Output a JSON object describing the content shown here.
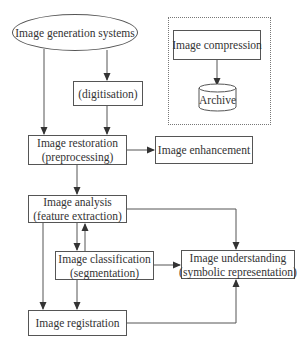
{
  "diagram": {
    "nodes": {
      "generation": {
        "line1": "Image generation systems",
        "shape": "ellipse"
      },
      "digitisation": {
        "line1": "(digitisation)",
        "shape": "rect"
      },
      "restoration": {
        "line1": "Image restoration",
        "line2": "(preprocessing)",
        "shape": "rect"
      },
      "enhancement": {
        "line1": "Image enhancement",
        "shape": "rect"
      },
      "compression": {
        "line1": "Image compression",
        "shape": "rect"
      },
      "archive": {
        "line1": "Archive",
        "shape": "cylinder"
      },
      "analysis": {
        "line1": "Image analysis",
        "line2": "(feature extraction)",
        "shape": "rect"
      },
      "classification": {
        "line1": "Image classification",
        "line2": "(segmentation)",
        "shape": "rect"
      },
      "understanding": {
        "line1": "Image understanding",
        "line2": "(symbolic representation)",
        "shape": "rect"
      },
      "registration": {
        "line1": "Image registration",
        "shape": "rect"
      }
    },
    "edges": [
      {
        "from": "generation",
        "to": "digitisation"
      },
      {
        "from": "generation",
        "to": "restoration"
      },
      {
        "from": "digitisation",
        "to": "restoration"
      },
      {
        "from": "restoration",
        "to": "enhancement"
      },
      {
        "from": "restoration",
        "to": "analysis"
      },
      {
        "from": "compression",
        "to": "archive"
      },
      {
        "from": "analysis",
        "to": "classification"
      },
      {
        "from": "classification",
        "to": "analysis"
      },
      {
        "from": "analysis",
        "to": "registration"
      },
      {
        "from": "classification",
        "to": "registration"
      },
      {
        "from": "analysis",
        "to": "understanding"
      },
      {
        "from": "classification",
        "to": "understanding"
      },
      {
        "from": "registration",
        "to": "understanding"
      }
    ],
    "group": {
      "style": "dotted",
      "members": [
        "compression",
        "archive"
      ]
    },
    "colors": {
      "line": "#444444",
      "background": "#ffffff"
    }
  }
}
